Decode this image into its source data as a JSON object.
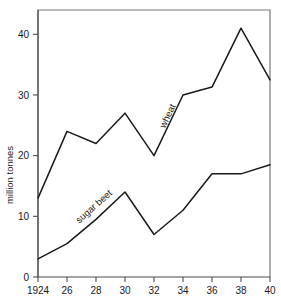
{
  "chart_data": {
    "type": "line",
    "title": "",
    "subtitle": "",
    "xlabel": "",
    "ylabel": "million tonnes",
    "x": [
      1924,
      1926,
      1928,
      1930,
      1932,
      1934,
      1936,
      1938,
      1940
    ],
    "xtick_labels": [
      "1924",
      "26",
      "28",
      "30",
      "32",
      "34",
      "36",
      "38",
      "40"
    ],
    "ytick_labels": [
      "0",
      "10",
      "20",
      "30",
      "40"
    ],
    "ytick_values": [
      0,
      10,
      20,
      30,
      40
    ],
    "xlim": [
      1924,
      1940
    ],
    "ylim": [
      0,
      44
    ],
    "grid": false,
    "legend": "inline-labels",
    "series": [
      {
        "name": "wheat",
        "label": "wheat",
        "color": "#1a1a1a",
        "values": [
          13,
          24,
          22,
          27,
          20,
          30,
          31.3,
          41,
          32.5
        ]
      },
      {
        "name": "sugar beet",
        "label": "sugar beet",
        "color": "#1a1a1a",
        "values": [
          3,
          5.5,
          9.5,
          14,
          7,
          11,
          17,
          17,
          18.5
        ]
      }
    ]
  },
  "axes": {
    "y_axis_title": "million tonnes"
  },
  "labels": {
    "wheat": "wheat",
    "sugar_beet": "sugar beet"
  },
  "colors": {
    "line": "#1a1a1a",
    "frame": "#6b6b6b",
    "axis": "#4d4d4d",
    "text": "#1a1a1a",
    "background": "#ffffff"
  }
}
